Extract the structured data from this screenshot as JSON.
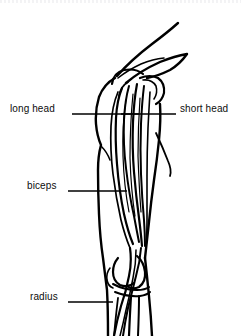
{
  "figure": {
    "style": "black-and-white line art",
    "background_color": "#ffffff",
    "line_color": "#000000",
    "text_color": "#0d0d0d",
    "width": 241,
    "height": 336
  },
  "labels": [
    {
      "id": "long-head",
      "text": "long head",
      "side": "left",
      "text_x": 10,
      "text_y": 103,
      "leader": {
        "x1": 72,
        "y1": 114,
        "x2": 139,
        "y2": 114
      }
    },
    {
      "id": "short-head",
      "text": "short head",
      "side": "right",
      "text_x": 180,
      "text_y": 103,
      "leader": {
        "x1": 121,
        "y1": 114,
        "x2": 176,
        "y2": 114
      }
    },
    {
      "id": "biceps",
      "text": "biceps",
      "side": "left",
      "text_x": 27,
      "text_y": 180,
      "leader": {
        "x1": 68,
        "y1": 191,
        "x2": 127,
        "y2": 191
      }
    },
    {
      "id": "radius",
      "text": "radius",
      "side": "left",
      "text_x": 30,
      "text_y": 291,
      "leader": {
        "x1": 68,
        "y1": 302,
        "x2": 113,
        "y2": 302
      }
    }
  ],
  "structures": [
    {
      "id": "clavicle",
      "name": "clavicle / acromion"
    },
    {
      "id": "humeral-head",
      "name": "head of humerus"
    },
    {
      "id": "deltoid-outline",
      "name": "deltoid and upper arm contour"
    },
    {
      "id": "long-head-fibers",
      "name": "long head muscle fibers"
    },
    {
      "id": "short-head-fibers",
      "name": "short head muscle fibers"
    },
    {
      "id": "biceps-tendon",
      "name": "distal biceps tendon"
    },
    {
      "id": "humeral-condyles",
      "name": "humeral condyles at elbow"
    },
    {
      "id": "radius-bone",
      "name": "radius"
    },
    {
      "id": "ulna-bone",
      "name": "ulna"
    }
  ]
}
